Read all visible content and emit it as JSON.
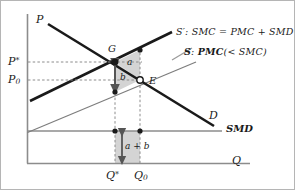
{
  "figure": {
    "axes": {
      "y_label": "P",
      "x_label": "Q"
    },
    "price_ticks": [
      {
        "id": "p_star",
        "label_main": "P",
        "label_sup": "*",
        "value_y": 62
      },
      {
        "id": "p_zero",
        "label_main": "P",
        "label_sub": "0",
        "value_y": 80
      }
    ],
    "quantity_ticks": [
      {
        "id": "q_star",
        "label_main": "Q",
        "label_sup": "*",
        "value_x": 115
      },
      {
        "id": "q_zero",
        "label_main": "Q",
        "label_sub": "0",
        "value_x": 140
      }
    ],
    "points": [
      {
        "id": "G",
        "label": "G",
        "x": 115,
        "y": 62,
        "style": "filled"
      },
      {
        "id": "E",
        "label": "E",
        "x": 140,
        "y": 80,
        "style": "open"
      }
    ],
    "curve_labels": [
      {
        "id": "demand",
        "label": "D"
      },
      {
        "id": "smd",
        "label": "SMD"
      }
    ],
    "legend": [
      {
        "id": "supply_social",
        "name": "S",
        "prime": "′",
        "separator": ":",
        "body": "SMC = PMC + SMD"
      },
      {
        "id": "supply_private",
        "name": "S",
        "prime": "",
        "separator": ":",
        "body": "PMC",
        "qualifier": "(< SMC)"
      }
    ],
    "areas": [
      {
        "id": "area_a",
        "label": "a"
      },
      {
        "id": "area_b",
        "label": "b"
      },
      {
        "id": "area_a_plus_b",
        "label": "a + b"
      }
    ],
    "colors": {
      "shade": "#d4d4d4",
      "shade_stroke": "#9a9a9a",
      "curve_thick": "#1a1a1a",
      "curve_thin": "#7d7d7d",
      "axis": "#8c8c8c",
      "dashed": "#8c8c8c",
      "text": "#1a1a1a",
      "background": "#ffffff",
      "border": "#b5b5b5"
    }
  }
}
